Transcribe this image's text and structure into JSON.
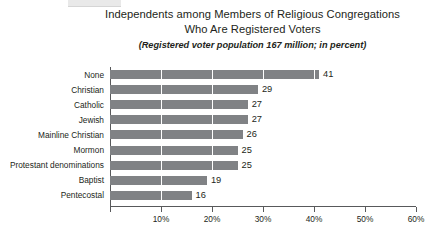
{
  "figure": {
    "topbar_name": "header-accent-bar",
    "title_line1": "Independents among Members of Religious Congregations",
    "title_line2": "Who Are Registered Voters",
    "subtitle": "(Registered voter population 167 million; in percent)"
  },
  "colors": {
    "bar": "#808285",
    "axis": "#58595b",
    "text": "#231f20",
    "background": "#ffffff",
    "gridline": "#ffffff",
    "topbar": "#e9e9e9"
  },
  "chart_data": {
    "type": "bar",
    "orientation": "horizontal",
    "title": "Independents among Members of Religious Congregations Who Are Registered Voters",
    "subtitle": "(Registered voter population 167 million; in percent)",
    "xlabel": "",
    "ylabel": "",
    "xlim": [
      0,
      60
    ],
    "xticks": [
      0,
      10,
      20,
      30,
      40,
      50,
      60
    ],
    "xtick_labels": [
      "",
      "10%",
      "20%",
      "30%",
      "40%",
      "50%",
      "60%"
    ],
    "grid": true,
    "legend": false,
    "categories": [
      "None",
      "Christian",
      "Catholic",
      "Jewish",
      "Mainline Christian",
      "Mormon",
      "Protestant denominations",
      "Baptist",
      "Pentecostal"
    ],
    "values": [
      41,
      29,
      27,
      27,
      26,
      25,
      25,
      19,
      16
    ],
    "value_labels": [
      "41",
      "29",
      "27",
      "27",
      "26",
      "25",
      "25",
      "19",
      "16"
    ]
  }
}
